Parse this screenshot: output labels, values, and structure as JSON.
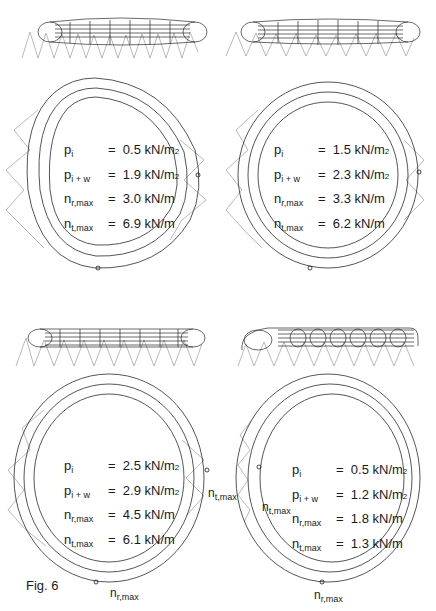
{
  "figure": {
    "caption": "Fig. 6",
    "panels": [
      {
        "id": "top-left",
        "params": [
          {
            "sym": "p",
            "sub": "i",
            "eq": "=",
            "value": "0.5 kN/m",
            "sup": "2"
          },
          {
            "sym": "p",
            "sub": "i + w",
            "eq": "=",
            "value": "1.9 kN/m",
            "sup": "2"
          },
          {
            "sym": "n",
            "sub": "r,max",
            "eq": "=",
            "value": "3.0 kN/m",
            "sup": ""
          },
          {
            "sym": "n",
            "sub": "t,max",
            "eq": "=",
            "value": "6.9 kN/m",
            "sup": ""
          }
        ]
      },
      {
        "id": "top-right",
        "params": [
          {
            "sym": "p",
            "sub": "i",
            "eq": "=",
            "value": "1.5 kN/m",
            "sup": "2"
          },
          {
            "sym": "p",
            "sub": "i + w",
            "eq": "=",
            "value": "2.3 kN/m",
            "sup": "2"
          },
          {
            "sym": "n",
            "sub": "r,max",
            "eq": "=",
            "value": "3.3 kN/m",
            "sup": ""
          },
          {
            "sym": "n",
            "sub": "t,max",
            "eq": "=",
            "value": "6.2 kN/m",
            "sup": ""
          }
        ]
      },
      {
        "id": "bottom-left",
        "params": [
          {
            "sym": "p",
            "sub": "i",
            "eq": "=",
            "value": "2.5 kN/m",
            "sup": "2"
          },
          {
            "sym": "p",
            "sub": "i + w",
            "eq": "=",
            "value": "2.9 kN/m",
            "sup": "2"
          },
          {
            "sym": "n",
            "sub": "r,max",
            "eq": "=",
            "value": "4.5 kN/m",
            "sup": ""
          },
          {
            "sym": "n",
            "sub": "t,max",
            "eq": "=",
            "value": "6.1 kN/m",
            "sup": ""
          }
        ],
        "markers": [
          {
            "sym": "n",
            "sub": "t,max"
          },
          {
            "sym": "n",
            "sub": "r,max"
          }
        ]
      },
      {
        "id": "bottom-right",
        "params": [
          {
            "sym": "p",
            "sub": "i",
            "eq": "=",
            "value": "0.5 kN/m",
            "sup": "2"
          },
          {
            "sym": "p",
            "sub": "i + w",
            "eq": "=",
            "value": "1.2 kN/m",
            "sup": "2"
          },
          {
            "sym": "n",
            "sub": "r,max",
            "eq": "=",
            "value": "1.8 kN/m",
            "sup": ""
          },
          {
            "sym": "n",
            "sub": "t,max",
            "eq": "=",
            "value": "1.3 kN/m",
            "sup": ""
          }
        ],
        "markers": [
          {
            "sym": "n",
            "sub": "t,max"
          },
          {
            "sym": "n",
            "sub": "r,max"
          }
        ]
      }
    ]
  },
  "colors": {
    "ink": "#1a1a1a",
    "mesh": "#2a2a2a",
    "load": "#8a8a8a",
    "background": "#ffffff"
  }
}
